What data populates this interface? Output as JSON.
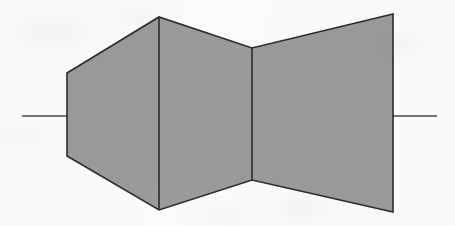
{
  "figure": {
    "caption": "",
    "canvas": {
      "width": 455,
      "height": 226
    },
    "style": {
      "background_color": "#fbfbfa",
      "body_fill_color": "#9a9a9a",
      "outline_color": "#2b2b2b",
      "centerline_color": "#4a4a4a",
      "outline_width": 1.6,
      "divider_width": 1.6,
      "centerline_width": 1.6
    },
    "centerline": {
      "y": 116,
      "left_stub": {
        "x1": 22,
        "x2": 67
      },
      "right_stub": {
        "x1": 393,
        "x2": 437
      }
    },
    "body_outline_points": "67,73 159,17 252,48 393,14 393,212 252,180 159,210 67,156",
    "sections": [
      {
        "name": "converging-inlet-section",
        "points": "67,73 159,17 159,210 67,156",
        "vertices": [
          {
            "x": 67,
            "y": 73
          },
          {
            "x": 159,
            "y": 17
          },
          {
            "x": 159,
            "y": 210
          },
          {
            "x": 67,
            "y": 156
          }
        ]
      },
      {
        "name": "throat-section",
        "points": "159,17 252,48 252,180 159,210",
        "vertices": [
          {
            "x": 159,
            "y": 17
          },
          {
            "x": 252,
            "y": 48
          },
          {
            "x": 252,
            "y": 180
          },
          {
            "x": 159,
            "y": 210
          }
        ]
      },
      {
        "name": "diverging-exit-section",
        "points": "252,48 393,14 393,212 252,180",
        "vertices": [
          {
            "x": 252,
            "y": 48
          },
          {
            "x": 393,
            "y": 14
          },
          {
            "x": 393,
            "y": 212
          },
          {
            "x": 252,
            "y": 180
          }
        ]
      }
    ],
    "internal_dividers": [
      {
        "name": "divider-inlet-throat",
        "x1": 159,
        "y1": 17,
        "x2": 159,
        "y2": 210
      },
      {
        "name": "divider-throat-exit",
        "x1": 252,
        "y1": 48,
        "x2": 252,
        "y2": 180
      }
    ]
  }
}
